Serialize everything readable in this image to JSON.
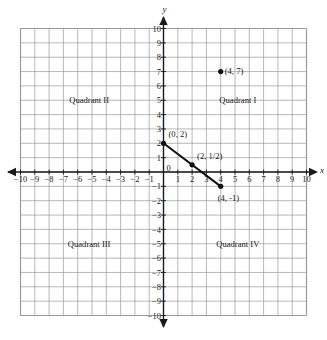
{
  "chart_data": {
    "type": "scatter",
    "title": "",
    "xlabel": "x",
    "ylabel": "y",
    "xlim": [
      -10,
      10
    ],
    "ylim": [
      -10,
      10
    ],
    "grid": true,
    "grid_color": "#9a9a9a",
    "axis_color": "#1a1a1a",
    "background": "#ffffff",
    "legend": "none",
    "x_ticks": [
      "-10",
      "-9",
      "-8",
      "-7",
      "-6",
      "-5",
      "-4",
      "-3",
      "-2",
      "-1",
      "0",
      "1",
      "2",
      "3",
      "4",
      "5",
      "6",
      "7",
      "8",
      "9",
      "10"
    ],
    "y_ticks": [
      "10",
      "9",
      "8",
      "7",
      "6",
      "5",
      "4",
      "3",
      "2",
      "1",
      "-1",
      "-2",
      "-3",
      "-4",
      "-5",
      "-6",
      "-7",
      "-8",
      "-9",
      "-10"
    ],
    "origin_label": "0",
    "points": [
      {
        "label": "(4, 7)",
        "x": 4,
        "y": 7,
        "label_dx": 4,
        "label_dy": 2.5,
        "on_line": false
      },
      {
        "label": "(0, 2)",
        "x": 0,
        "y": 2,
        "label_dx": 5,
        "label_dy": -6,
        "on_line": true
      },
      {
        "label": "(2, 1/2)",
        "x": 2,
        "y": 0.5,
        "label_dx": 5,
        "label_dy": -6,
        "on_line": true
      },
      {
        "label": "(4, -1)",
        "x": 4,
        "y": -1,
        "label_dx": -3,
        "label_dy": 15,
        "on_line": true
      }
    ],
    "segments": [
      {
        "name": "line-segment",
        "x1": 0,
        "y1": 2,
        "x2": 4,
        "y2": -1,
        "color": "#111111",
        "width": 2
      }
    ],
    "quadrants": [
      {
        "name": "Quadrant I",
        "x": 5.2,
        "y": 5
      },
      {
        "name": "Quadrant II",
        "x": -5.2,
        "y": 5
      },
      {
        "name": "Quadrant III",
        "x": -5.2,
        "y": -5
      },
      {
        "name": "Quadrant IV",
        "x": 5.2,
        "y": -5
      }
    ],
    "axis_arrows": [
      "left",
      "right",
      "up",
      "down"
    ]
  }
}
